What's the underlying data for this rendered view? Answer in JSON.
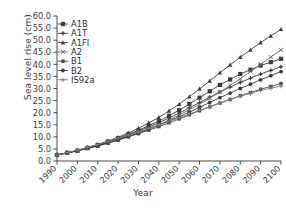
{
  "chart_data": {
    "type": "line",
    "title": "",
    "xlabel": "Year",
    "ylabel": "Sea level rise (cm)",
    "xlim": [
      1990,
      2100
    ],
    "ylim": [
      0,
      60
    ],
    "xticks": [
      1990,
      2000,
      2010,
      2020,
      2030,
      2040,
      2050,
      2060,
      2070,
      2080,
      2090,
      2100
    ],
    "xticklabels": [
      "1990",
      "2000",
      "2010",
      "2020",
      "2030",
      "2040",
      "2050",
      "2060",
      "2070",
      "2080",
      "2090",
      "2100"
    ],
    "yticks": [
      0,
      5,
      10,
      15,
      20,
      25,
      30,
      35,
      40,
      45,
      50,
      55,
      60
    ],
    "yticklabels": [
      "0.0",
      "5.0",
      "10.0",
      "15.0",
      "20.0",
      "25.0",
      "30.0",
      "35.0",
      "40.0",
      "45.0",
      "50.0",
      "55.0",
      "60.0"
    ],
    "grid": false,
    "legend_position": "upper left",
    "x": [
      1990,
      2000,
      2010,
      2020,
      2030,
      2040,
      2050,
      2060,
      2070,
      2080,
      2090,
      2100
    ],
    "series": [
      {
        "name": "A1B",
        "marker": "square",
        "color": "#3b3b3b",
        "values": [
          2.5,
          4.3,
          6.6,
          9.4,
          12.7,
          16.5,
          21.0,
          26.2,
          31.5,
          36.0,
          39.5,
          42.3
        ]
      },
      {
        "name": "A1T",
        "marker": "plus-filled",
        "color": "#3b3b3b",
        "values": [
          2.5,
          4.3,
          6.5,
          9.2,
          12.3,
          15.8,
          19.8,
          24.2,
          28.6,
          32.5,
          36.0,
          39.0
        ]
      },
      {
        "name": "A1FI",
        "marker": "triangle",
        "color": "#3b3b3b",
        "values": [
          2.5,
          4.4,
          6.8,
          9.8,
          13.5,
          18.0,
          23.5,
          29.8,
          36.5,
          43.0,
          49.0,
          54.5
        ]
      },
      {
        "name": "A2",
        "marker": "x",
        "color": "#6e6e6e",
        "values": [
          2.5,
          4.2,
          6.3,
          8.8,
          11.7,
          15.0,
          19.0,
          23.5,
          28.5,
          34.0,
          40.0,
          46.0
        ]
      },
      {
        "name": "B1",
        "marker": "square-small",
        "color": "#4a4a4a",
        "values": [
          2.5,
          4.2,
          6.2,
          8.6,
          11.3,
          14.2,
          17.4,
          20.8,
          24.0,
          27.0,
          29.7,
          32.0
        ]
      },
      {
        "name": "B2",
        "marker": "circle",
        "color": "#3b3b3b",
        "values": [
          2.5,
          4.2,
          6.3,
          8.8,
          11.6,
          14.8,
          18.3,
          22.2,
          26.2,
          30.0,
          33.6,
          37.0
        ]
      },
      {
        "name": "IS92a",
        "marker": "plus",
        "color": "#7a7a7a",
        "values": [
          2.5,
          4.5,
          6.8,
          9.3,
          12.0,
          14.9,
          17.9,
          21.0,
          24.0,
          26.8,
          29.2,
          31.0
        ]
      }
    ]
  },
  "legend": {
    "entries": [
      "A1B",
      "A1T",
      "A1FI",
      "A2",
      "B1",
      "B2",
      "IS92a"
    ]
  },
  "axes": {
    "x_title": "Year",
    "y_title": "Sea level rise (cm)"
  }
}
